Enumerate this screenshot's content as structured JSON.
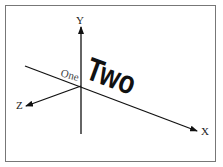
{
  "diagram": {
    "axes": {
      "x_label": "X",
      "y_label": "Y",
      "z_label": "Z"
    },
    "texts": {
      "one": "One",
      "two": "Two"
    },
    "colors": {
      "axis": "#111111",
      "frame": "#777777",
      "background": "#ffffff"
    }
  }
}
